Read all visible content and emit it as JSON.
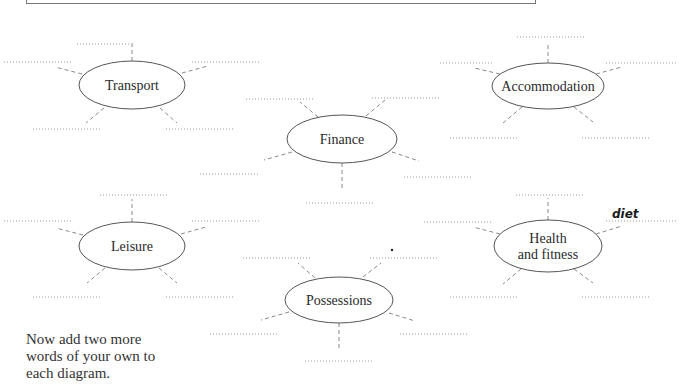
{
  "page": {
    "instruction_lines": [
      "Now add two more",
      "words of your own to",
      "each diagram."
    ]
  },
  "diagrams": [
    {
      "id": "transport",
      "label_lines": [
        "Transport"
      ],
      "cx": 132,
      "cy": 85,
      "rx": 53,
      "ry": 24,
      "spokes": [
        {
          "x1": 132,
          "y1": 61,
          "x2": 132,
          "y2": 42
        },
        {
          "x1": 82,
          "y1": 74,
          "x2": 55,
          "y2": 67
        },
        {
          "x1": 182,
          "y1": 73,
          "x2": 208,
          "y2": 66
        },
        {
          "x1": 104,
          "y1": 108,
          "x2": 86,
          "y2": 123
        },
        {
          "x1": 160,
          "y1": 108,
          "x2": 177,
          "y2": 123
        }
      ],
      "blanks": [
        {
          "x": 77,
          "y": 44,
          "w": 52,
          "value": ""
        },
        {
          "x": 4,
          "y": 62,
          "w": 68,
          "value": ""
        },
        {
          "x": 192,
          "y": 62,
          "w": 68,
          "value": ""
        },
        {
          "x": 33,
          "y": 129,
          "w": 68,
          "value": ""
        },
        {
          "x": 166,
          "y": 129,
          "w": 68,
          "value": ""
        }
      ]
    },
    {
      "id": "accommodation",
      "label_lines": [
        "Accommodation"
      ],
      "cx": 548,
      "cy": 86,
      "rx": 56,
      "ry": 23,
      "spokes": [
        {
          "x1": 548,
          "y1": 63,
          "x2": 548,
          "y2": 42
        },
        {
          "x1": 500,
          "y1": 74,
          "x2": 474,
          "y2": 68
        },
        {
          "x1": 596,
          "y1": 74,
          "x2": 622,
          "y2": 67
        },
        {
          "x1": 522,
          "y1": 107,
          "x2": 503,
          "y2": 123
        },
        {
          "x1": 574,
          "y1": 107,
          "x2": 593,
          "y2": 122
        }
      ],
      "blanks": [
        {
          "x": 517,
          "y": 37,
          "w": 68,
          "value": ""
        },
        {
          "x": 440,
          "y": 63,
          "w": 52,
          "value": ""
        },
        {
          "x": 606,
          "y": 63,
          "w": 70,
          "value": ""
        },
        {
          "x": 450,
          "y": 138,
          "w": 68,
          "value": ""
        },
        {
          "x": 582,
          "y": 138,
          "w": 68,
          "value": ""
        }
      ]
    },
    {
      "id": "finance",
      "label_lines": [
        "Finance"
      ],
      "cx": 342,
      "cy": 139,
      "rx": 55,
      "ry": 24,
      "spokes": [
        {
          "x1": 318,
          "y1": 117,
          "x2": 300,
          "y2": 102
        },
        {
          "x1": 366,
          "y1": 116,
          "x2": 385,
          "y2": 100
        },
        {
          "x1": 292,
          "y1": 152,
          "x2": 264,
          "y2": 160
        },
        {
          "x1": 392,
          "y1": 152,
          "x2": 419,
          "y2": 161
        },
        {
          "x1": 342,
          "y1": 163,
          "x2": 342,
          "y2": 188
        }
      ],
      "blanks": [
        {
          "x": 246,
          "y": 99,
          "w": 68,
          "value": ""
        },
        {
          "x": 372,
          "y": 98,
          "w": 68,
          "value": ""
        },
        {
          "x": 200,
          "y": 174,
          "w": 60,
          "value": ""
        },
        {
          "x": 404,
          "y": 177,
          "w": 68,
          "value": ""
        },
        {
          "x": 306,
          "y": 203,
          "w": 68,
          "value": ""
        }
      ]
    },
    {
      "id": "leisure",
      "label_lines": [
        "Leisure"
      ],
      "cx": 132,
      "cy": 246,
      "rx": 53,
      "ry": 24,
      "spokes": [
        {
          "x1": 132,
          "y1": 222,
          "x2": 132,
          "y2": 199
        },
        {
          "x1": 83,
          "y1": 235,
          "x2": 56,
          "y2": 228
        },
        {
          "x1": 181,
          "y1": 234,
          "x2": 206,
          "y2": 227
        },
        {
          "x1": 105,
          "y1": 268,
          "x2": 87,
          "y2": 283
        },
        {
          "x1": 159,
          "y1": 268,
          "x2": 177,
          "y2": 283
        }
      ],
      "blanks": [
        {
          "x": 100,
          "y": 195,
          "w": 68,
          "value": ""
        },
        {
          "x": 4,
          "y": 221,
          "w": 68,
          "value": ""
        },
        {
          "x": 192,
          "y": 221,
          "w": 68,
          "value": ""
        },
        {
          "x": 33,
          "y": 297,
          "w": 68,
          "value": ""
        },
        {
          "x": 166,
          "y": 297,
          "w": 68,
          "value": ""
        }
      ]
    },
    {
      "id": "health-and-fitness",
      "label_lines": [
        "Health",
        "and fitness"
      ],
      "cx": 548,
      "cy": 246,
      "rx": 54,
      "ry": 26,
      "spokes": [
        {
          "x1": 548,
          "y1": 220,
          "x2": 548,
          "y2": 198
        },
        {
          "x1": 500,
          "y1": 234,
          "x2": 473,
          "y2": 227
        },
        {
          "x1": 596,
          "y1": 234,
          "x2": 622,
          "y2": 226
        },
        {
          "x1": 521,
          "y1": 269,
          "x2": 503,
          "y2": 284
        },
        {
          "x1": 574,
          "y1": 269,
          "x2": 593,
          "y2": 283
        }
      ],
      "blanks": [
        {
          "x": 516,
          "y": 195,
          "w": 68,
          "value": ""
        },
        {
          "x": 424,
          "y": 222,
          "w": 68,
          "value": ""
        },
        {
          "x": 606,
          "y": 221,
          "w": 70,
          "value": "diet"
        },
        {
          "x": 450,
          "y": 297,
          "w": 68,
          "value": ""
        },
        {
          "x": 582,
          "y": 297,
          "w": 68,
          "value": ""
        }
      ]
    },
    {
      "id": "possessions",
      "label_lines": [
        "Possessions"
      ],
      "cx": 339,
      "cy": 300,
      "rx": 54,
      "ry": 23,
      "spokes": [
        {
          "x1": 315,
          "y1": 278,
          "x2": 298,
          "y2": 263
        },
        {
          "x1": 363,
          "y1": 277,
          "x2": 381,
          "y2": 263
        },
        {
          "x1": 289,
          "y1": 312,
          "x2": 261,
          "y2": 320
        },
        {
          "x1": 389,
          "y1": 313,
          "x2": 415,
          "y2": 321
        },
        {
          "x1": 339,
          "y1": 323,
          "x2": 339,
          "y2": 349
        }
      ],
      "blanks": [
        {
          "x": 243,
          "y": 258,
          "w": 68,
          "value": ""
        },
        {
          "x": 370,
          "y": 258,
          "w": 68,
          "value": ""
        },
        {
          "x": 210,
          "y": 334,
          "w": 68,
          "value": ""
        },
        {
          "x": 400,
          "y": 334,
          "w": 68,
          "value": ""
        },
        {
          "x": 305,
          "y": 361,
          "w": 68,
          "value": ""
        }
      ]
    }
  ],
  "stray_marks": [
    {
      "x": 392,
      "y": 250
    }
  ],
  "colors": {
    "ellipse_stroke": "#555555",
    "spoke": "#8a8a8a",
    "blank": "#9a9a9a",
    "text": "#2a2a2a",
    "handwriting": "#1a1a1a"
  }
}
